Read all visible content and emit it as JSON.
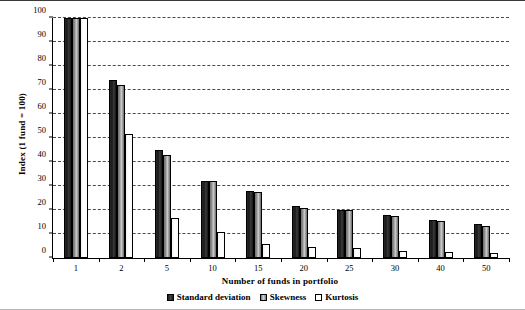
{
  "chart_data": {
    "type": "bar",
    "title": "",
    "xlabel": "Number of funds in portfolio",
    "ylabel": "Index (1 fund = 100)",
    "categories": [
      "1",
      "2",
      "5",
      "10",
      "15",
      "20",
      "25",
      "30",
      "40",
      "50"
    ],
    "series": [
      {
        "name": "Standard deviation",
        "color": "#1f1f1f",
        "values": [
          100,
          74,
          45,
          32,
          28,
          21.5,
          20,
          18,
          16,
          14
        ]
      },
      {
        "name": "Skewness",
        "color": "#9a9a9a",
        "values": [
          100,
          72,
          43,
          32,
          27.5,
          21,
          20,
          17.5,
          15.5,
          13.5
        ]
      },
      {
        "name": "Kurtosis",
        "color": "#ffffff",
        "values": [
          100,
          51.5,
          16.5,
          11,
          6,
          4.5,
          4,
          3,
          2.5,
          2
        ]
      }
    ],
    "ylim": [
      0,
      100
    ],
    "yticks": [
      0,
      10,
      20,
      30,
      40,
      50,
      60,
      70,
      80,
      90,
      100
    ],
    "grid": "horizontal-dashed",
    "legend_position": "bottom-center"
  }
}
